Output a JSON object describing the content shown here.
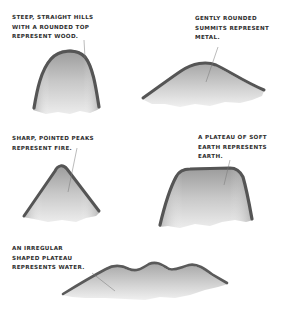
{
  "figure": {
    "colors": {
      "ridge": "#5a5a5a",
      "fill_light": "#e6e6e6",
      "fill_mid": "#bdbdbd",
      "text": "#2e2e2e",
      "background": "#ffffff"
    },
    "items": [
      {
        "element": "Wood",
        "shape": "steep-rounded",
        "lines": [
          "STEEP, STRAIGHT HILLS",
          "WITH A ROUNDED TOP",
          "REPRESENT WOOD."
        ]
      },
      {
        "element": "Metal",
        "shape": "gently-rounded",
        "lines": [
          "GENTLY ROUNDED",
          "SUMMITS REPRESENT",
          "METAL."
        ]
      },
      {
        "element": "Fire",
        "shape": "pointed-peak",
        "lines": [
          "SHARP, POINTED PEAKS",
          "REPRESENT FIRE."
        ]
      },
      {
        "element": "Earth",
        "shape": "plateau",
        "lines": [
          "A PLATEAU OF SOFT",
          "EARTH REPRESENTS",
          "EARTH."
        ]
      },
      {
        "element": "Water",
        "shape": "irregular-plateau",
        "lines": [
          "AN IRREGULAR",
          "SHAPED PLATEAU",
          "REPRESENTS WATER."
        ]
      }
    ]
  }
}
